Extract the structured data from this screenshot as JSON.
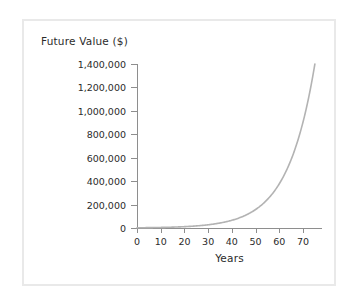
{
  "chart_data": {
    "type": "line",
    "title": "",
    "ylabel": "Future Value ($)",
    "xlabel": "Years",
    "xlim": [
      0,
      78
    ],
    "ylim": [
      0,
      1400000
    ],
    "grid": false,
    "legend": false,
    "series": [
      {
        "name": "Future Value",
        "color": "#b3b3b3",
        "description": "Exponential compound-growth curve rising slowly until about year 40 then sharply to 1,400,000 near year 75",
        "x": [
          0,
          5,
          10,
          15,
          20,
          25,
          30,
          35,
          40,
          45,
          50,
          55,
          60,
          65,
          70,
          75
        ],
        "values": [
          2000,
          3200,
          5200,
          8400,
          13500,
          21800,
          35200,
          56800,
          91600,
          147700,
          238200,
          384200,
          619700,
          999500,
          1150000,
          1400000
        ]
      }
    ],
    "x_ticks": [
      0,
      10,
      20,
      30,
      40,
      50,
      60,
      70
    ],
    "x_tick_labels": [
      "0",
      "10",
      "20",
      "30",
      "40",
      "50",
      "60",
      "70"
    ],
    "y_ticks": [
      0,
      200000,
      400000,
      600000,
      800000,
      1000000,
      1200000,
      1400000
    ],
    "y_tick_labels": [
      "0",
      "200,000",
      "400,000",
      "600,000",
      "800,000",
      "1,000,000",
      "1,200,000",
      "1,400,000"
    ],
    "axis_color": "#8e8e8e",
    "text_color": "#2b2b2b",
    "frame_color": "#e9e9e9",
    "background": "#ffffff"
  }
}
